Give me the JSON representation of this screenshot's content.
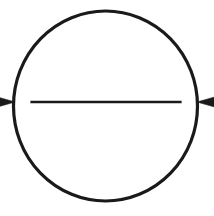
{
  "figure": {
    "name": "circle-with-diameter-arrow",
    "title": "Circle with double-headed diameter arrow",
    "background_color": "#ffffff",
    "ink_color": "#1a1a1a",
    "canvas": {
      "width": 214,
      "height": 216
    },
    "circle": {
      "name": "circle-outline",
      "center_x": 105.5,
      "center_y": 106,
      "radius_x": 92,
      "radius_y": 95,
      "stroke_width": 3.2,
      "fill": "none",
      "stroke_color": "#1a1a1a"
    },
    "arrow": {
      "name": "diameter-double-arrow",
      "label": "",
      "y": 102,
      "x_start": 15,
      "x_end": 197,
      "shaft_thickness": 2.6,
      "shaft_color": "#1a1a1a",
      "head_length": 28,
      "head_half_height": 8,
      "head_notch": 5,
      "heads": [
        {
          "name": "arrowhead-left",
          "direction": "left",
          "tip_x": 15,
          "tip_y": 102
        },
        {
          "name": "arrowhead-right",
          "direction": "right",
          "tip_x": 197,
          "tip_y": 102
        }
      ]
    }
  },
  "chart_data": {
    "type": "diagram",
    "title": "Circle with double-headed diameter arrow",
    "elements": [
      {
        "shape": "circle",
        "label": "circle outline",
        "center": [
          105.5,
          106
        ],
        "radius": 92,
        "stroke": "#1a1a1a",
        "stroke_width": 3.2,
        "fill": "none"
      },
      {
        "shape": "double-arrow",
        "label": "diameter",
        "from": [
          15,
          102
        ],
        "to": [
          197,
          102
        ],
        "stroke": "#1a1a1a",
        "stroke_width": 2.6,
        "arrowheads": [
          "start",
          "end"
        ]
      }
    ],
    "annotations": [],
    "xlabel": "",
    "ylabel": "",
    "legend": []
  }
}
